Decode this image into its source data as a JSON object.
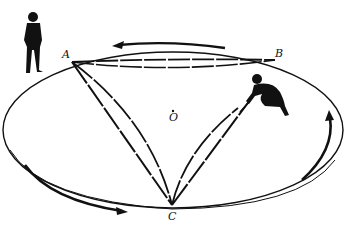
{
  "diagram": {
    "colors": {
      "ink": "#111111",
      "background": "#ffffff"
    },
    "points": {
      "A": {
        "label": "A",
        "x": 72,
        "y": 62
      },
      "B": {
        "label": "B",
        "x": 275,
        "y": 60
      },
      "C": {
        "label": "C",
        "x": 172,
        "y": 205
      },
      "O": {
        "label": "O",
        "x": 173,
        "y": 115
      }
    },
    "rotation_arrows": [
      {
        "name": "top-arrow",
        "direction": "left"
      },
      {
        "name": "bottom-left-arrow",
        "direction": "right"
      },
      {
        "name": "right-arrow",
        "direction": "up"
      }
    ],
    "figures": [
      {
        "name": "standing-observer",
        "position": "outside, left of A"
      },
      {
        "name": "crouching-person",
        "position": "on platform, near B"
      }
    ]
  }
}
